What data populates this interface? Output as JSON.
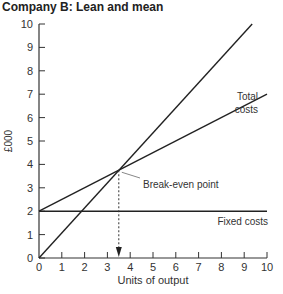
{
  "chart_data": {
    "type": "line",
    "title": "Company B: Lean and mean",
    "xlabel": "Units of output",
    "ylabel": "£000",
    "xlim": [
      0,
      10
    ],
    "ylim": [
      0,
      10
    ],
    "x_ticks": [
      "0",
      "1",
      "2",
      "3",
      "4",
      "5",
      "6",
      "7",
      "8",
      "9",
      "10"
    ],
    "y_ticks": [
      "0",
      "1",
      "2",
      "3",
      "4",
      "5",
      "6",
      "7",
      "8",
      "9",
      "10"
    ],
    "series": [
      {
        "name": "Total costs",
        "x": [
          0,
          10
        ],
        "y": [
          2,
          7
        ]
      },
      {
        "name": "Revenue",
        "x": [
          0,
          9.35
        ],
        "y": [
          0,
          10
        ]
      },
      {
        "name": "Fixed costs",
        "x": [
          0,
          10
        ],
        "y": [
          2,
          2
        ]
      }
    ],
    "annotations": [
      {
        "text": "Break-even point",
        "x": 3.5,
        "y": 3.75
      },
      {
        "text": "Total costs",
        "x": 9.3,
        "y": 7.6
      },
      {
        "text": "Fixed costs",
        "x": 8.5,
        "y": 1.6
      }
    ],
    "grid": false
  }
}
